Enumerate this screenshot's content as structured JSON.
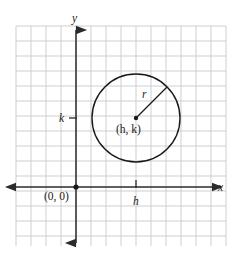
{
  "figure": {
    "kind": "coordinate-plane-circle-diagram",
    "background_color": "#ffffff",
    "grid": {
      "visible": true,
      "line_color": "#c9c9ce",
      "cell_size": 15,
      "left": 16,
      "top": 26,
      "right": 226,
      "bottom": 246,
      "columns": 14,
      "rows": 15
    },
    "axes": {
      "color": "#2b2b2b",
      "x_axis_y": 187,
      "y_axis_x": 76,
      "x_label": "x",
      "y_label": "y",
      "x_arrow_left_x": 16,
      "x_arrow_right_x": 212,
      "y_arrow_top_y": 30,
      "y_arrow_bottom_y": 243
    },
    "origin": {
      "label": "(0, 0)",
      "x": 76,
      "y": 187,
      "dot_radius": 2.6,
      "label_x": 44,
      "label_y": 200
    },
    "circle": {
      "center_x": 136,
      "center_y": 118,
      "radius": 44,
      "stroke_color": "#1a1a1a",
      "stroke_width": 1.4,
      "fill": "none",
      "center_label": "(h, k)",
      "center_label_x": 116,
      "center_label_y": 133,
      "center_dot_radius": 2.2
    },
    "radius_line": {
      "label": "r",
      "from_x": 136,
      "from_y": 118,
      "to_x": 167,
      "to_y": 87,
      "label_x": 142,
      "label_y": 98,
      "stroke_color": "#1a1a1a"
    },
    "ticks": [
      {
        "name": "h",
        "label": "h",
        "axis": "x",
        "position_x": 136,
        "position_y": 187,
        "label_x": 133,
        "label_y": 205
      },
      {
        "name": "k",
        "label": "k",
        "axis": "y",
        "position_x": 76,
        "position_y": 118,
        "label_x": 59,
        "label_y": 122
      }
    ]
  }
}
